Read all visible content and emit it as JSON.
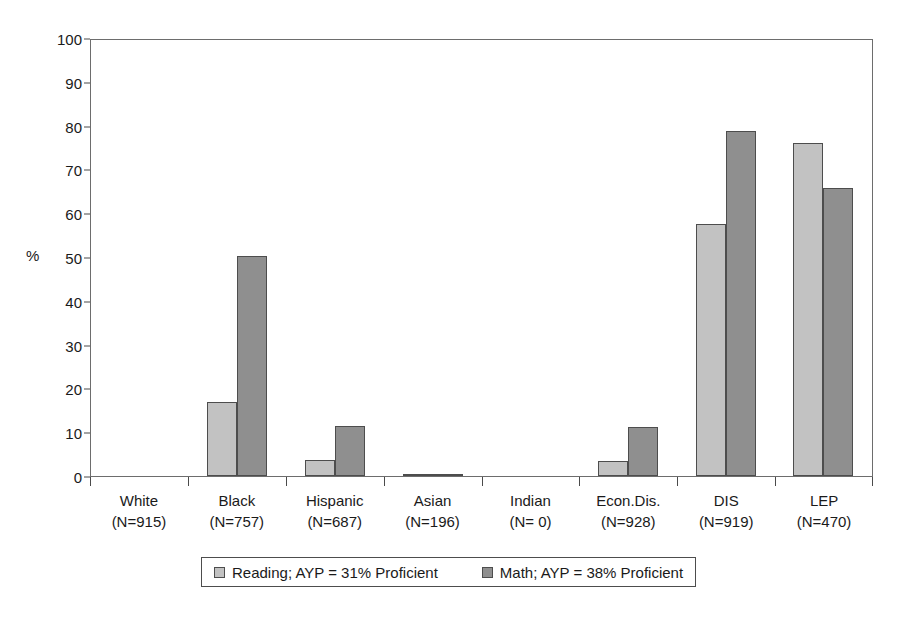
{
  "chart_data": {
    "type": "bar",
    "title": "",
    "xlabel": "",
    "ylabel": "%",
    "ylim": [
      0,
      100
    ],
    "yticks": [
      0,
      10,
      20,
      30,
      40,
      50,
      60,
      70,
      80,
      90,
      100
    ],
    "grid": false,
    "legend_position": "bottom",
    "categories": [
      "White",
      "Black",
      "Hispanic",
      "Asian",
      "Indian",
      "Econ.Dis.",
      "DIS",
      "LEP"
    ],
    "category_counts": [
      "(N=915)",
      "(N=757)",
      "(N=687)",
      "(N=196)",
      "(N= 0)",
      "(N=928)",
      "(N=919)",
      "(N=470)"
    ],
    "series": [
      {
        "name": "Reading; AYP=31% Proficient",
        "color": "#c2c2c2",
        "values": [
          0,
          17,
          3.7,
          0.5,
          0,
          3.4,
          57.5,
          76
        ]
      },
      {
        "name": "Math; AYP=38% Proficient",
        "color": "#8f8f8f",
        "values": [
          0,
          50.2,
          11.4,
          0.5,
          0,
          11.1,
          78.8,
          65.8
        ]
      }
    ]
  },
  "legend": {
    "entries": [
      {
        "label": "Reading; AYP = 31% Proficient",
        "swatch": "reading"
      },
      {
        "label": "Math; AYP = 38% Proficient",
        "swatch": "math"
      }
    ]
  }
}
